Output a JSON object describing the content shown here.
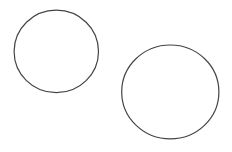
{
  "canvas": {
    "width": 232,
    "height": 152,
    "background": "#ffffff"
  },
  "shapes": [
    {
      "type": "ellipse",
      "name": "circle-left",
      "cx": 56.3,
      "cy": 51.4,
      "rx": 42.2,
      "ry": 41.3,
      "stroke": "#444444",
      "stroke_width": 1.2,
      "fill": "none"
    },
    {
      "type": "ellipse",
      "name": "circle-right",
      "cx": 170.3,
      "cy": 91.9,
      "rx": 48.6,
      "ry": 46.9,
      "stroke": "#444444",
      "stroke_width": 1.2,
      "fill": "none"
    }
  ]
}
